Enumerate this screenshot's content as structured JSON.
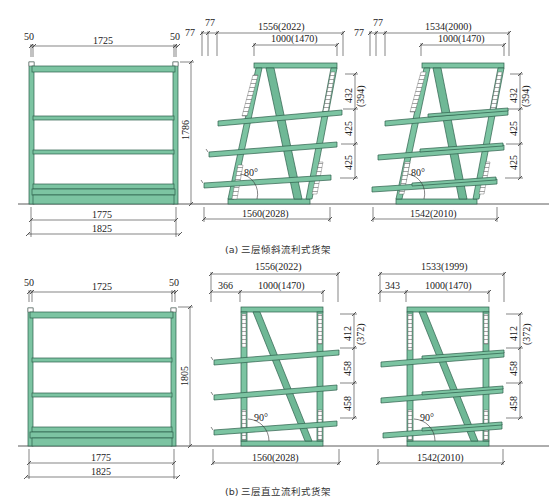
{
  "figure": {
    "colors": {
      "member_fill": "#7cc4a2",
      "member_stroke": "#2d5f4a",
      "line": "#333333",
      "background": "#ffffff"
    },
    "part_a": {
      "caption": "(a) 三层倾斜流利式货架",
      "front_view": {
        "top_left_offset": "50",
        "top_inner_width": "1725",
        "top_right_offset": "50",
        "height": "1786",
        "bottom_inner_width": "1775",
        "bottom_total_width": "1825"
      },
      "side_view_1": {
        "offset_1": "77",
        "offset_2": "77",
        "top_total": "1556(2022)",
        "top_span": "1000(1470)",
        "tier_1": "432",
        "tier_1_alt": "(394)",
        "tier_2": "425",
        "tier_3": "425",
        "angle": "80°",
        "base_width": "1560(2028)"
      },
      "side_view_2": {
        "offset_1": "77",
        "offset_2": "77",
        "top_total": "1534(2000)",
        "top_span": "1000(1470)",
        "tier_1": "432",
        "tier_1_alt": "(394)",
        "tier_2": "425",
        "tier_3": "425",
        "angle": "80°",
        "base_width": "1542(2010)"
      }
    },
    "part_b": {
      "caption": "(b) 三层直立流利式货架",
      "front_view": {
        "top_left_offset": "50",
        "top_inner_width": "1725",
        "top_right_offset": "50",
        "height": "1805",
        "bottom_inner_width": "1775",
        "bottom_total_width": "1825"
      },
      "side_view_1": {
        "top_total": "1556(2022)",
        "left_offset": "366",
        "top_span": "1000(1470)",
        "tier_1": "412",
        "tier_1_alt": "(372)",
        "tier_2": "458",
        "tier_3": "458",
        "angle": "90°",
        "base_width": "1560(2028)"
      },
      "side_view_2": {
        "top_total": "1533(1999)",
        "left_offset": "343",
        "top_span": "1000(1470)",
        "tier_1": "412",
        "tier_1_alt": "(372)",
        "tier_2": "458",
        "tier_3": "458",
        "angle": "90°",
        "base_width": "1542(2010)"
      }
    }
  }
}
